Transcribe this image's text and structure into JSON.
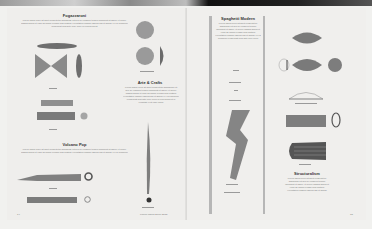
{
  "spread": {
    "left_page": {
      "sections": [
        {
          "title": "Fogazzaroni",
          "body": "Lorem ipsum dolor sit amet consectetur adipiscing elit sed do eiusmod tempor incididunt ut labore et dolore magna aliqua ut enim ad minim veniam quis nostrud exercitation ullamco laboris nisi ut aliquip ex ea commodo consequat duis aute irure dolor in reprehenderit"
        },
        {
          "title": "Arte & Crafts",
          "body": "Lorem ipsum dolor sit amet consectetur adipiscing elit sed do eiusmod tempor incididunt ut labore et dolore magna aliqua ut enim ad minim veniam quis nostrud exercitation ullamco laboris nisi ut aliquip ex ea commodo consequat duis aute irure dolor in reprehenderit in voluptate velit esse cillum"
        },
        {
          "title": "Volcano Pop",
          "body": "Lorem ipsum dolor sit amet consectetur adipiscing elit sed do eiusmod tempor incididunt ut labore et dolore magna aliqua ut enim ad minim veniam quis nostrud exercitation ullamco laboris nisi ut aliquip ex ea commodo"
        }
      ],
      "page_number": "14",
      "footer": "Lorem Ipsum Dolor 2015"
    },
    "right_page": {
      "sections": [
        {
          "title": "Spaghetti Modern",
          "body": "Lorem ipsum dolor sit amet consectetur adipiscing elit sed do eiusmod tempor incididunt ut labore et dolore magna aliqua ut enim ad minim veniam quis nostrud exercitation ullamco laboris nisi ut aliquip ex ea commodo consequat duis aute irure dolor"
        },
        {
          "title": "Structuralism",
          "body": "Lorem ipsum dolor sit amet consectetur adipiscing elit sed do eiusmod tempor incididunt ut labore et dolore magna aliqua ut enim ad minim veniam quis nostrud exercitation ullamco laboris nisi ut aliquip"
        }
      ],
      "page_number": "15"
    }
  },
  "colors": {
    "page": "#efeeec",
    "ink": "#333333",
    "shape": "#7d7d7d",
    "bar": "#b6b6b6",
    "band_dark": "#111111"
  }
}
